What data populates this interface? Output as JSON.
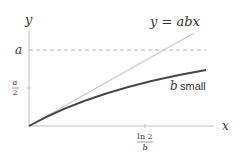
{
  "diagram": {
    "axes": {
      "x_label": "x",
      "y_label": "y"
    },
    "y_ticks": [
      {
        "label": "a",
        "position": "a"
      },
      {
        "label_num": "a",
        "label_den": "2",
        "position": "a/2"
      }
    ],
    "x_ticks": [
      {
        "label_num": "ln 2",
        "label_den": "b",
        "position": "ln2/b"
      }
    ],
    "curves": [
      {
        "name": "linear",
        "label": "y = abx",
        "color": "#c8c8c8",
        "style": "solid"
      },
      {
        "name": "saturating",
        "label_var": "b",
        "label_text": "small",
        "color": "#444444",
        "style": "solid"
      }
    ],
    "asymptote": {
      "label": "a",
      "color": "#b0b0b0",
      "style": "dashed"
    }
  }
}
